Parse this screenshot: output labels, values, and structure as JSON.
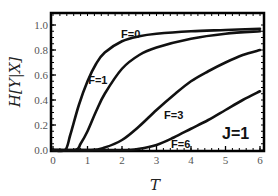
{
  "chart_data": {
    "type": "line",
    "title": "",
    "xlabel": "T",
    "ylabel": "H[Y|X]",
    "xlim": [
      0,
      6
    ],
    "ylim": [
      0,
      1.05
    ],
    "xticks": [
      0,
      1,
      2,
      3,
      4,
      5,
      6
    ],
    "yticks": [
      0.0,
      0.2,
      0.4,
      0.6,
      0.8,
      1.0
    ],
    "xtick_labels": [
      "0",
      "1",
      "2",
      "3",
      "4",
      "5",
      "6"
    ],
    "ytick_labels": [
      "0.0",
      "0.2",
      "0.4",
      "0.6",
      "0.8",
      "1.0"
    ],
    "grid": false,
    "legend": "inline curve labels",
    "annotation": "J=1",
    "series": [
      {
        "name": "F=0",
        "label": "F=0",
        "label_pos": [
          2.25,
          0.9
        ],
        "x": [
          0,
          0.35,
          0.5,
          0.75,
          1.0,
          1.25,
          1.5,
          2.0,
          2.5,
          3.0,
          4.0,
          5.0,
          6.0
        ],
        "y": [
          0,
          0,
          0.12,
          0.36,
          0.55,
          0.69,
          0.78,
          0.87,
          0.91,
          0.93,
          0.95,
          0.96,
          0.97
        ]
      },
      {
        "name": "F=1",
        "label": "F=1",
        "label_pos": [
          1.3,
          0.53
        ],
        "x": [
          0,
          0.65,
          0.8,
          1.0,
          1.25,
          1.5,
          2.0,
          2.5,
          3.0,
          4.0,
          5.0,
          6.0
        ],
        "y": [
          0,
          0,
          0.05,
          0.15,
          0.31,
          0.45,
          0.65,
          0.76,
          0.82,
          0.89,
          0.93,
          0.95
        ]
      },
      {
        "name": "F=3",
        "label": "F=3",
        "label_pos": [
          3.5,
          0.25
        ],
        "x": [
          0,
          1.1,
          1.5,
          2.0,
          2.5,
          3.0,
          3.5,
          4.0,
          4.5,
          5.0,
          5.5,
          6.0
        ],
        "y": [
          0,
          0,
          0.02,
          0.08,
          0.19,
          0.32,
          0.44,
          0.55,
          0.63,
          0.7,
          0.76,
          0.8
        ]
      },
      {
        "name": "F=6",
        "label": "F=6",
        "label_pos": [
          3.7,
          0.02
        ],
        "x": [
          0,
          2.0,
          2.5,
          3.0,
          3.5,
          4.0,
          4.5,
          5.0,
          5.5,
          6.0
        ],
        "y": [
          0,
          0,
          0.01,
          0.04,
          0.1,
          0.17,
          0.24,
          0.32,
          0.4,
          0.47
        ]
      }
    ]
  }
}
